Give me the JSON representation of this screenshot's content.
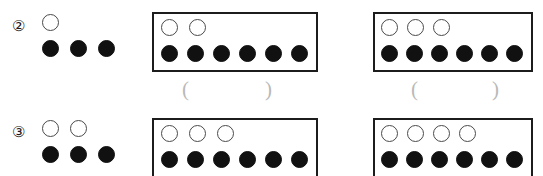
{
  "worksheet": {
    "width": 543,
    "height": 176,
    "background_color": "#ffffff",
    "white_circle_color": "#ffffff",
    "white_circle_border_color": "#4a4a4a",
    "black_circle_color": "#111111",
    "box_border_color": "#1c1c1c",
    "blank_paren_color": "#b9b9b9",
    "rows": [
      {
        "marker": "②",
        "marker_name": "circled-digit-two",
        "groups": [
          {
            "kind": "open",
            "white_circles": 1,
            "black_circles": 3,
            "answer_blank": null
          },
          {
            "kind": "boxed",
            "white_circles": 2,
            "black_circles": 6,
            "answer_blank": {
              "open": "(",
              "value": "",
              "close": ")"
            }
          },
          {
            "kind": "boxed",
            "white_circles": 3,
            "black_circles": 6,
            "answer_blank": {
              "open": "(",
              "value": "",
              "close": ")"
            }
          }
        ]
      },
      {
        "marker": "③",
        "marker_name": "circled-digit-three",
        "groups": [
          {
            "kind": "open",
            "white_circles": 2,
            "black_circles": 3,
            "answer_blank": null
          },
          {
            "kind": "boxed",
            "white_circles": 3,
            "black_circles": 6,
            "answer_blank": null
          },
          {
            "kind": "boxed",
            "white_circles": 4,
            "black_circles": 6,
            "answer_blank": null
          }
        ]
      }
    ]
  }
}
